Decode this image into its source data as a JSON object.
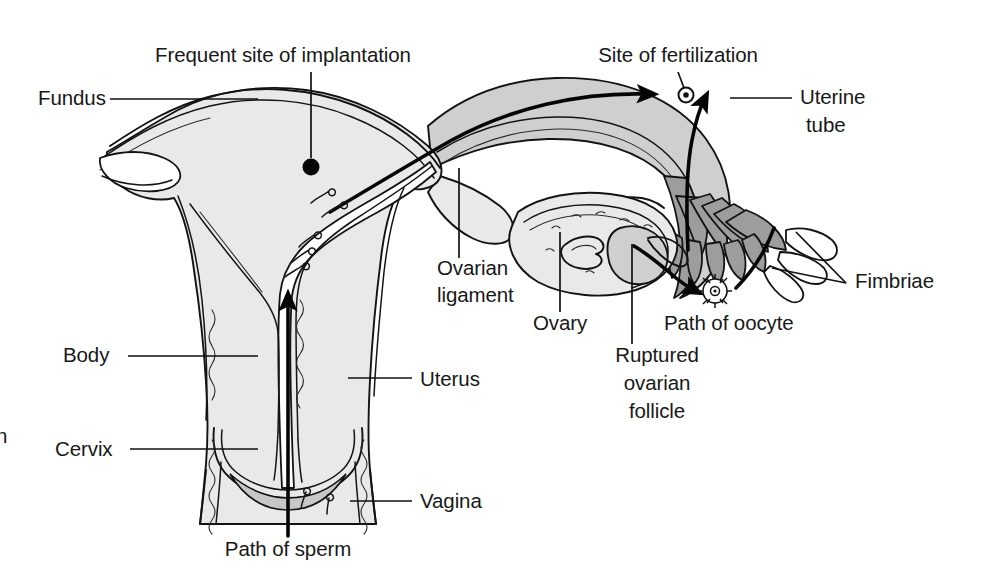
{
  "figure": {
    "domain": "anatomical line diagram",
    "background_color": "#ffffff",
    "ink_color": "#131313",
    "tones": {
      "light_gray": "#e9e9e9",
      "mid_gray": "#cfcfcf",
      "dark_gray": "#9d9d9d",
      "white": "#ffffff"
    }
  },
  "labels": {
    "frequent_site_of_implantation": "Frequent site of implantation",
    "fundus": "Fundus",
    "site_of_fertilization": "Site of fertilization",
    "uterine_tube_line1": "Uterine",
    "uterine_tube_line2": "tube",
    "ovarian_ligament_line1": "Ovarian",
    "ovarian_ligament_line2": "ligament",
    "fimbriae": "Fimbriae",
    "ovary": "Ovary",
    "path_of_oocyte": "Path of oocyte",
    "ruptured_follicle_line1": "Ruptured",
    "ruptured_follicle_line2": "ovarian",
    "ruptured_follicle_line3": "follicle",
    "body": "Body",
    "uterus": "Uterus",
    "cervix": "Cervix",
    "vagina": "Vagina",
    "path_of_sperm": "Path of sperm",
    "clipped_edge_fragment": "n"
  },
  "label_positions": {
    "frequent_site_of_implantation": {
      "x": 283,
      "y": 62,
      "anchor": "middle"
    },
    "fundus": {
      "x": 38,
      "y": 105,
      "anchor": "start"
    },
    "site_of_fertilization": {
      "x": 678,
      "y": 62,
      "anchor": "middle"
    },
    "uterine_tube_line1": {
      "x": 800,
      "y": 104,
      "anchor": "start"
    },
    "uterine_tube_line2": {
      "x": 800,
      "y": 132,
      "anchor": "start"
    },
    "ovarian_ligament_line1": {
      "x": 437,
      "y": 275,
      "anchor": "start"
    },
    "ovarian_ligament_line2": {
      "x": 437,
      "y": 302,
      "anchor": "start"
    },
    "fimbriae": {
      "x": 855,
      "y": 288,
      "anchor": "start"
    },
    "ovary": {
      "x": 533,
      "y": 330,
      "anchor": "start"
    },
    "path_of_oocyte": {
      "x": 664,
      "y": 330,
      "anchor": "start"
    },
    "ruptured_follicle_line1": {
      "x": 657,
      "y": 362,
      "anchor": "middle"
    },
    "ruptured_follicle_line2": {
      "x": 657,
      "y": 390,
      "anchor": "middle"
    },
    "ruptured_follicle_line3": {
      "x": 657,
      "y": 418,
      "anchor": "middle"
    },
    "body": {
      "x": 63,
      "y": 362,
      "anchor": "start"
    },
    "uterus": {
      "x": 420,
      "y": 386,
      "anchor": "start"
    },
    "cervix": {
      "x": 55,
      "y": 456,
      "anchor": "start"
    },
    "vagina": {
      "x": 420,
      "y": 508,
      "anchor": "start"
    },
    "path_of_sperm": {
      "x": 288,
      "y": 556,
      "anchor": "middle"
    },
    "clipped_edge_fragment": {
      "x": 0,
      "y": 443,
      "anchor": "start"
    }
  },
  "structures": [
    {
      "name": "uterus-fundus",
      "tone": "light_gray",
      "note": "dome-shaped top of uterus"
    },
    {
      "name": "uterine-body-wall",
      "tone": "light_gray",
      "note": "myometrium walls flanking cavity"
    },
    {
      "name": "uterine-cavity",
      "tone": "white",
      "note": "triangular lumen of uterus"
    },
    {
      "name": "cervix",
      "tone": "light_gray",
      "note": "narrow neck with fornices"
    },
    {
      "name": "vagina",
      "tone": "light_gray",
      "note": "canal below cervix"
    },
    {
      "name": "uterine-tube",
      "tone": "mid_gray",
      "note": "S-curved oviduct on right"
    },
    {
      "name": "uterine-tube-lumen",
      "tone": "white",
      "note": "inner channel of oviduct"
    },
    {
      "name": "infundibulum-fimbriae",
      "tone": "dark_gray",
      "note": "finger-like fringes at tube end"
    },
    {
      "name": "ovary",
      "tone": "light_gray",
      "note": "oval body with follicle stipples"
    },
    {
      "name": "ruptured-ovarian-follicle",
      "tone": "mid_gray",
      "note": "bulge on ovary surface"
    },
    {
      "name": "corpus-luteum",
      "tone": "light_gray",
      "note": "convoluted shape inside ovary"
    },
    {
      "name": "ovarian-ligament",
      "tone": "light_gray",
      "note": "band joining ovary to uterus"
    },
    {
      "name": "broad-ligament-folds",
      "tone": "white",
      "note": "thin serosal folds left and right"
    }
  ],
  "markers": {
    "implantation_dot": {
      "x": 311,
      "y": 167,
      "r": 8,
      "color": "#050505"
    },
    "fertilization_ovum": {
      "x": 686,
      "y": 95,
      "r": 6,
      "color": "#050505"
    },
    "oocyte_cluster": {
      "x": 715,
      "y": 291,
      "r": 14,
      "note": "corona radiata, spiky ring"
    },
    "sperm_cells_in_uterus": 5,
    "sperm_cells_in_vagina": 2
  },
  "flow_arrows": [
    {
      "name": "path-of-sperm-arrow",
      "direction": "upward",
      "note": "vertical line from vagina through cervix into uterine cavity"
    },
    {
      "name": "sperm-into-tube-arrow",
      "direction": "rightward-up",
      "note": "from uterus through tube to fertilization site"
    },
    {
      "name": "oocyte-up-tube-arrow",
      "direction": "upward-left",
      "note": "from fimbriae up the tube to fertilization site"
    },
    {
      "name": "path-of-oocyte-arrow",
      "direction": "rightward-down",
      "note": "from ruptured follicle to oocyte"
    },
    {
      "name": "oocyte-to-fimbriae-arrow",
      "direction": "upward-right",
      "note": "from oocyte toward fimbriae"
    }
  ]
}
